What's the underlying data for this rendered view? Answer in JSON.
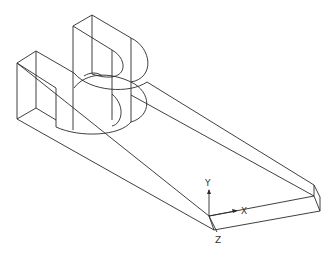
{
  "viewport": {
    "background": "#ffffff",
    "line_color": "#2a2a2a",
    "view": "isometric wireframe"
  },
  "model": {
    "name": "U-shaped bracket on base plate",
    "parts": [
      "base-plate",
      "left-block",
      "upper-block",
      "front-half-cylinder",
      "back-half-cylinder"
    ]
  },
  "ucs": {
    "x_label": "X",
    "y_label": "Y",
    "z_label": "Z"
  }
}
